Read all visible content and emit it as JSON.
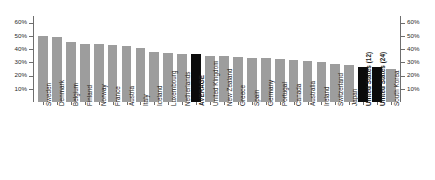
{
  "chart_data": {
    "type": "bar",
    "title": "",
    "subtitle": "",
    "xlabel": "",
    "ylabel": "",
    "ylim": [
      0,
      65
    ],
    "grid": false,
    "legend": null,
    "axis_ticks": [
      "10%",
      "20%",
      "30%",
      "40%",
      "50%",
      "60%"
    ],
    "axis_tick_values": [
      10,
      20,
      30,
      40,
      50,
      60
    ],
    "left_axis_ticks": [
      "10%",
      "20%",
      "30%",
      "40%",
      "50%",
      "60%"
    ],
    "right_axis_ticks": [
      "10%",
      "20%",
      "30%",
      "40%",
      "50%",
      "60%"
    ],
    "highlight_color": "#0b0b0b",
    "bar_color": "#9d9d9d",
    "highlighted_categories": [
      "AVERAGE",
      "United States (12)",
      "United States (24)"
    ],
    "categories": [
      "Sweden",
      "Denmark",
      "Belgium",
      "Finland",
      "Norway",
      "France",
      "Austria",
      "Italy",
      "Iceland",
      "Luxembourg",
      "Netherlands",
      "AVERAGE",
      "United Kingdom",
      "New Zealand",
      "Greece",
      "Spain",
      "Germany",
      "Portugal",
      "Canada",
      "Australia",
      "Ireland",
      "Switzerland",
      "Japan",
      "United States (12)",
      "United States (24)",
      "South Korea"
    ],
    "values": [
      50,
      49,
      45,
      44,
      44,
      43,
      42,
      41,
      38,
      37,
      36.5,
      36,
      35,
      34.5,
      34,
      33.5,
      33,
      32.5,
      32,
      31,
      30.5,
      29,
      28,
      26.5,
      26.5,
      25
    ]
  }
}
